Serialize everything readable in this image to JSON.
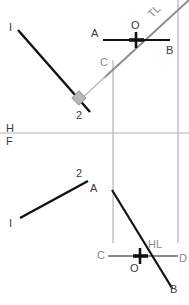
{
  "drawing": {
    "title": "Descriptive geometry two-view orthographic projection",
    "colors": {
      "black_line": "#111111",
      "gray_line": "#8c8c8c",
      "thin_gray": "#b4b4b4",
      "label_text": "#3a3a3a",
      "right_angle_fill": "#b9b9b9"
    }
  },
  "fold_line": {
    "top_label": "H",
    "bottom_label": "F"
  },
  "top_view": {
    "line_ab": {
      "start_label": "A",
      "end_label": "B"
    },
    "line_cd": {
      "start_label": "C",
      "note_label": "TL"
    },
    "line_i2": {
      "start_label": "I",
      "end_label": "2"
    },
    "point_o": "O"
  },
  "front_view": {
    "line_ab": {
      "start_label": "A",
      "end_label": "B"
    },
    "line_cd": {
      "start_label": "C",
      "end_label": "D",
      "note_label": "HL"
    },
    "line_i2": {
      "start_label": "I",
      "end_label": "2"
    },
    "point_o": "O"
  }
}
